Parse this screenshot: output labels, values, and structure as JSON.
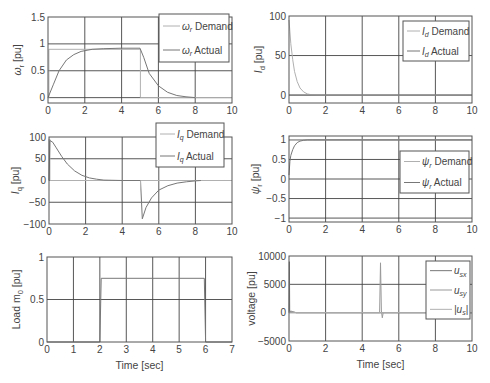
{
  "figure": {
    "background": "#ffffff",
    "axis_color": "#555555",
    "grid_color": "#444444",
    "demand_color": "#b0b0b0",
    "actual_color": "#777777"
  },
  "chart_data": [
    {
      "id": "omega",
      "type": "line",
      "title": "",
      "xlabel": "",
      "ylabel": "ω_r [pu]",
      "ylabel_main": "ω",
      "ylabel_sub": "r",
      "ylabel_unit": " [pu]",
      "xlim": [
        0,
        10
      ],
      "ylim": [
        -0.1,
        1.5
      ],
      "xticks": [
        0,
        2,
        4,
        6,
        8,
        10
      ],
      "yticks": [
        0,
        0.5,
        1,
        1.5
      ],
      "ytick_labels": [
        "0",
        "0.5",
        "1",
        "1.5"
      ],
      "grid": true,
      "box": {
        "x": 48,
        "y": 17,
        "w": 184,
        "h": 86
      },
      "legend": {
        "position": "upper right",
        "box": {
          "x": 159,
          "y": 14,
          "w": 70,
          "h": 48
        },
        "entries": [
          {
            "main": "ω",
            "sub": "r",
            "rest": " Demand",
            "color": "#b0b0b0"
          },
          {
            "main": "ω",
            "sub": "r",
            "rest": " Actual",
            "color": "#777777"
          }
        ]
      },
      "series": [
        {
          "name": "ω_r Demand",
          "color": "#b0b0b0",
          "x": [
            0,
            0.05,
            0.05,
            5.0,
            5.02,
            5.02,
            10
          ],
          "y": [
            0,
            0,
            0.9,
            0.9,
            0.9,
            0,
            0
          ]
        },
        {
          "name": "ω_r Actual",
          "color": "#777777",
          "x": [
            0,
            0.3,
            0.6,
            1.0,
            1.4,
            1.8,
            2.4,
            3.0,
            4.0,
            5.0,
            5.2,
            5.5,
            6.0,
            6.5,
            7.0,
            7.5,
            8.0
          ],
          "y": [
            0,
            0.25,
            0.5,
            0.7,
            0.8,
            0.86,
            0.9,
            0.91,
            0.92,
            0.92,
            0.75,
            0.45,
            0.22,
            0.1,
            0.04,
            0.015,
            0.0
          ]
        }
      ]
    },
    {
      "id": "id",
      "type": "line",
      "title": "",
      "xlabel": "",
      "ylabel": "I_d [pu]",
      "ylabel_main": "I",
      "ylabel_sub": "d",
      "ylabel_unit": " [pu]",
      "xlim": [
        0,
        10
      ],
      "ylim": [
        -10,
        100
      ],
      "xticks": [
        0,
        2,
        4,
        6,
        8,
        10
      ],
      "yticks": [
        0,
        50,
        100
      ],
      "ytick_labels": [
        "0",
        "50",
        "100"
      ],
      "grid": true,
      "box": {
        "x": 289,
        "y": 16,
        "w": 183,
        "h": 87
      },
      "legend": {
        "position": "upper right",
        "box": {
          "x": 403,
          "y": 21,
          "w": 66,
          "h": 40
        },
        "entries": [
          {
            "main": "I",
            "sub": "d",
            "rest": " Demand",
            "color": "#b0b0b0"
          },
          {
            "main": "I",
            "sub": "d",
            "rest": " Actual",
            "color": "#777777"
          }
        ]
      },
      "series": [
        {
          "name": "I_d Demand",
          "color": "#b0b0b0",
          "x": [
            0,
            0.05,
            0.1,
            0.2,
            0.3,
            0.45,
            0.6,
            0.8,
            1.0,
            1.2,
            1.5,
            10
          ],
          "y": [
            95,
            80,
            65,
            45,
            30,
            17,
            9,
            4,
            1.5,
            0.5,
            0,
            0
          ]
        },
        {
          "name": "I_d Actual",
          "color": "#777777",
          "x": [
            0,
            10
          ],
          "y": [
            0,
            0
          ]
        }
      ]
    },
    {
      "id": "iq",
      "type": "line",
      "title": "",
      "xlabel": "",
      "ylabel": "I_q [pu]",
      "ylabel_main": "I",
      "ylabel_sub": "q",
      "ylabel_unit": " [pu]",
      "xlim": [
        0,
        10
      ],
      "ylim": [
        -100,
        100
      ],
      "xticks": [
        0,
        2,
        4,
        6,
        8,
        10
      ],
      "yticks": [
        -100,
        -50,
        0,
        50,
        100
      ],
      "ytick_labels": [
        "−100",
        "−50",
        "0",
        "50",
        "100"
      ],
      "grid": true,
      "box": {
        "x": 49,
        "y": 137,
        "w": 183,
        "h": 87
      },
      "legend": {
        "position": "upper right",
        "box": {
          "x": 156,
          "y": 123,
          "w": 68,
          "h": 44
        },
        "entries": [
          {
            "main": "I",
            "sub": "q",
            "rest": " Demand",
            "color": "#b0b0b0"
          },
          {
            "main": "I",
            "sub": "q",
            "rest": " Actual",
            "color": "#777777"
          }
        ]
      },
      "series": [
        {
          "name": "I_q Demand",
          "color": "#b0b0b0",
          "x": [
            0,
            0.0,
            0.05,
            0.05,
            10
          ],
          "y": [
            0,
            95,
            95,
            0,
            0
          ]
        },
        {
          "name": "I_q Actual",
          "color": "#777777",
          "x": [
            0,
            0.05,
            0.2,
            0.4,
            0.7,
            1.0,
            1.4,
            1.8,
            2.2,
            2.6,
            3.0,
            4.0,
            5.0,
            5.0,
            5.1,
            5.3,
            5.6,
            6.0,
            6.5,
            7.0,
            7.5,
            8.0,
            8.3
          ],
          "y": [
            0,
            92,
            88,
            75,
            55,
            38,
            22,
            12,
            6,
            3,
            1,
            0,
            0,
            0,
            -88,
            -62,
            -40,
            -22,
            -12,
            -6,
            -3,
            -1,
            0
          ]
        },
        {
          "name": "I_q Demand step",
          "color": "#b0b0b0",
          "x": [
            5.0,
            5.0
          ],
          "y": [
            0,
            -20
          ]
        }
      ]
    },
    {
      "id": "psi",
      "type": "line",
      "title": "",
      "xlabel": "",
      "ylabel": "ψ_r [pu]",
      "ylabel_main": "ψ",
      "ylabel_sub": "r",
      "ylabel_unit": " [pu]",
      "xlim": [
        0,
        10
      ],
      "ylim": [
        -1.1,
        1.1
      ],
      "xticks": [
        0,
        2,
        4,
        6,
        8,
        10
      ],
      "yticks": [
        -1,
        -0.5,
        0,
        0.5,
        1
      ],
      "ytick_labels": [
        "−1",
        "−0.5",
        "0",
        "0.5",
        "1"
      ],
      "grid": true,
      "box": {
        "x": 289,
        "y": 136,
        "w": 183,
        "h": 86
      },
      "legend": {
        "position": "center right",
        "box": {
          "x": 400,
          "y": 151,
          "w": 69,
          "h": 42
        },
        "entries": [
          {
            "main": "ψ",
            "sub": "r",
            "rest": " Demand",
            "color": "#b0b0b0"
          },
          {
            "main": "ψ",
            "sub": "r",
            "rest": " Actual",
            "color": "#777777"
          }
        ]
      },
      "series": [
        {
          "name": "ψ_r Demand",
          "color": "#b0b0b0",
          "x": [
            0,
            10
          ],
          "y": [
            1,
            1
          ]
        },
        {
          "name": "ψ_r Actual",
          "color": "#777777",
          "x": [
            0,
            0.05,
            0.1,
            0.2,
            0.3,
            0.45,
            0.6,
            0.8,
            1.0,
            1.3,
            2.0,
            10
          ],
          "y": [
            0.1,
            0.45,
            0.6,
            0.75,
            0.85,
            0.93,
            0.97,
            0.99,
            1.0,
            1.0,
            1.0,
            1.0
          ]
        }
      ]
    },
    {
      "id": "load",
      "type": "line",
      "title": "",
      "xlabel": "Time [sec]",
      "ylabel": "Load m_0 [pu]",
      "ylabel_main": "Load m",
      "ylabel_sub": "0",
      "ylabel_unit": " [pu]",
      "xlim": [
        0,
        7
      ],
      "ylim": [
        0,
        1
      ],
      "xticks": [
        0,
        1,
        2,
        3,
        4,
        5,
        6,
        7
      ],
      "yticks": [
        0,
        0.5,
        1
      ],
      "ytick_labels": [
        "0",
        "0.5",
        "1"
      ],
      "grid": true,
      "box": {
        "x": 47,
        "y": 257,
        "w": 185,
        "h": 85
      },
      "legend": null,
      "series": [
        {
          "name": "Load m_0",
          "color": "#777777",
          "x": [
            0,
            2.0,
            2.05,
            5.95,
            6.0,
            7
          ],
          "y": [
            0,
            0,
            0.75,
            0.75,
            0,
            0
          ]
        }
      ]
    },
    {
      "id": "voltage",
      "type": "line",
      "title": "",
      "xlabel": "Time [sec]",
      "ylabel": "voltage [pu]",
      "ylabel_main": "voltage",
      "ylabel_sub": "",
      "ylabel_unit": " [pu]",
      "xlim": [
        0,
        10
      ],
      "ylim": [
        -5000,
        10000
      ],
      "xticks": [
        0,
        2,
        4,
        6,
        8,
        10
      ],
      "yticks": [
        -5000,
        0,
        5000,
        10000
      ],
      "ytick_labels": [
        "−5000",
        "0",
        "5000",
        "10000"
      ],
      "grid": true,
      "box": {
        "x": 289,
        "y": 256,
        "w": 183,
        "h": 85
      },
      "legend": {
        "position": "upper right",
        "box": {
          "x": 426,
          "y": 261,
          "w": 44,
          "h": 58
        },
        "entries": [
          {
            "main": "u",
            "sub": "sx",
            "rest": "",
            "color": "#777777"
          },
          {
            "main": "u",
            "sub": "sy",
            "rest": "",
            "color": "#999999"
          },
          {
            "main": "|u",
            "sub": "s",
            "rest": "|",
            "color": "#b0b0b0"
          }
        ]
      },
      "series": [
        {
          "name": "u_sx",
          "color": "#777777",
          "x": [
            0,
            0.02,
            0.04,
            0.4,
            10
          ],
          "y": [
            0,
            9000,
            200,
            0,
            0
          ]
        },
        {
          "name": "u_sy",
          "color": "#999999",
          "x": [
            0,
            0.1,
            0.4,
            4.95,
            5.0,
            5.05,
            5.1,
            5.15,
            10
          ],
          "y": [
            0,
            300,
            0,
            0,
            8800,
            300,
            -900,
            0,
            0
          ]
        },
        {
          "name": "|u_s|",
          "color": "#b0b0b0",
          "x": [
            0,
            10
          ],
          "y": [
            0,
            0
          ]
        }
      ]
    }
  ]
}
